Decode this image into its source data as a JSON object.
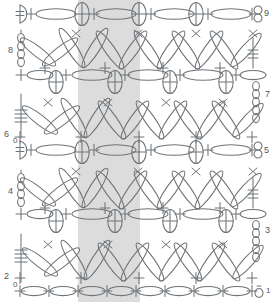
{
  "chart": {
    "type": "crochet-symbol-chart",
    "background_color": "#ffffff",
    "stroke_color": "#6f7478",
    "repeat_band": {
      "label": "pattern-repeat",
      "color": "#dcdcdc",
      "x": 78,
      "width": 62
    },
    "row_labels_left": [
      {
        "text": "8",
        "x": 8,
        "y": 46
      },
      {
        "text": "6",
        "x": 4,
        "y": 130
      },
      {
        "text": "0",
        "x": 13,
        "y": 137
      },
      {
        "text": "4",
        "x": 8,
        "y": 187
      },
      {
        "text": "2",
        "x": 4,
        "y": 272
      },
      {
        "text": "0",
        "x": 13,
        "y": 281
      }
    ],
    "row_labels_right": [
      {
        "text": "9",
        "x": 259,
        "y": 10
      },
      {
        "text": "7",
        "x": 262,
        "y": 92
      },
      {
        "text": "5",
        "x": 259,
        "y": 148
      },
      {
        "text": "3",
        "x": 262,
        "y": 228
      },
      {
        "text": "1",
        "x": 263,
        "y": 285
      }
    ],
    "legend_symbols": [
      {
        "name": "single-crochet",
        "glyph": "plus-cross"
      },
      {
        "name": "chain-stitch",
        "glyph": "horizontal-oval"
      },
      {
        "name": "puff-stitch",
        "glyph": "oval-with-cross"
      },
      {
        "name": "treble-crochet",
        "glyph": "line-with-bars"
      },
      {
        "name": "extended-stitch",
        "glyph": "long-slanted-oval"
      },
      {
        "name": "turning-chain",
        "glyph": "d-shape"
      }
    ],
    "rows": [
      {
        "number": 9,
        "kind": "shell-row"
      },
      {
        "number": 8,
        "kind": "lattice-row"
      },
      {
        "number": 7,
        "kind": "shell-row"
      },
      {
        "number": 6,
        "kind": "lattice-row"
      },
      {
        "number": 5,
        "kind": "shell-row"
      },
      {
        "number": 4,
        "kind": "lattice-row"
      },
      {
        "number": 3,
        "kind": "shell-row"
      },
      {
        "number": 2,
        "kind": "lattice-row"
      },
      {
        "number": 1,
        "kind": "foundation-row"
      }
    ]
  }
}
